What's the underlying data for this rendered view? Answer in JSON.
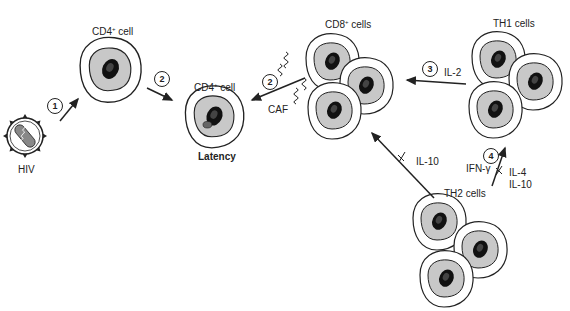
{
  "figure": {
    "labels": {
      "cd4_cell_top": "CD4",
      "cd4_cell_top_sup": "+",
      "cd4_cell_top_suffix": " cell",
      "cd4_cell_latent": "CD4",
      "cd4_cell_latent_sup": "+",
      "cd4_cell_latent_suffix": " cell",
      "latency": "Latency",
      "hiv": "HIV",
      "cd8_cells": "CD8",
      "cd8_cells_sup": "+",
      "cd8_cells_suffix": " cells",
      "th1_cells": "TH1 cells",
      "th2_cells": "TH2 cells",
      "caf": "CAF",
      "il2": "IL-2",
      "il10_block": "IL-10",
      "ifn_gamma": "IFN-γ",
      "il4": "IL-4",
      "il10_th2": "IL-10"
    },
    "steps": [
      "1",
      "2",
      "2",
      "3",
      "4"
    ],
    "colors": {
      "outline": "#222222",
      "cytoplasm": "#c8c8c8",
      "nucleus": "#111111",
      "background": "#ffffff"
    }
  }
}
